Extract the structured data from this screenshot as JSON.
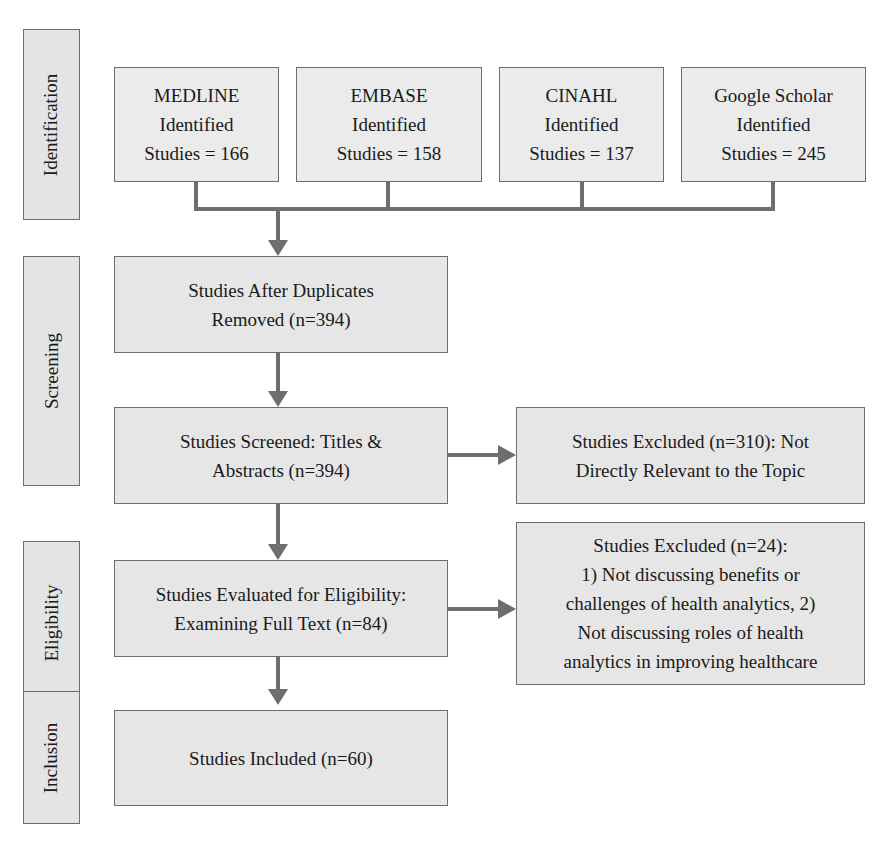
{
  "phases": {
    "identification": "Identification",
    "screening": "Screening",
    "eligibility": "Eligibility",
    "inclusion": "Inclusion"
  },
  "sources": [
    {
      "name": "MEDLINE",
      "label": "Identified",
      "count_text": "Studies = 166",
      "count": 166
    },
    {
      "name": "EMBASE",
      "label": "Identified",
      "count_text": "Studies = 158",
      "count": 158
    },
    {
      "name": "CINAHL",
      "label": "Identified",
      "count_text": "Studies = 137",
      "count": 137
    },
    {
      "name": "Google Scholar",
      "label": "Identified",
      "count_text": "Studies = 245",
      "count": 245
    }
  ],
  "steps": {
    "duplicates_removed": "Studies After Duplicates\nRemoved (n=394)",
    "screened": "Studies Screened: Titles &\nAbstracts (n=394)",
    "eligibility": "Studies Evaluated for Eligibility:\nExamining Full Text (n=84)",
    "included": "Studies Included (n=60)"
  },
  "exclusions": {
    "screening": "Studies Excluded (n=310): Not\nDirectly Relevant to the Topic",
    "eligibility": "Studies Excluded (n=24):\n1) Not discussing benefits or\nchallenges of health analytics, 2)\nNot discussing roles of health\nanalytics in improving healthcare"
  },
  "colors": {
    "box_fill": "#e6e6e6",
    "border": "#6e6e6e",
    "arrow": "#6e6e6e",
    "text": "#1a1a1a"
  }
}
